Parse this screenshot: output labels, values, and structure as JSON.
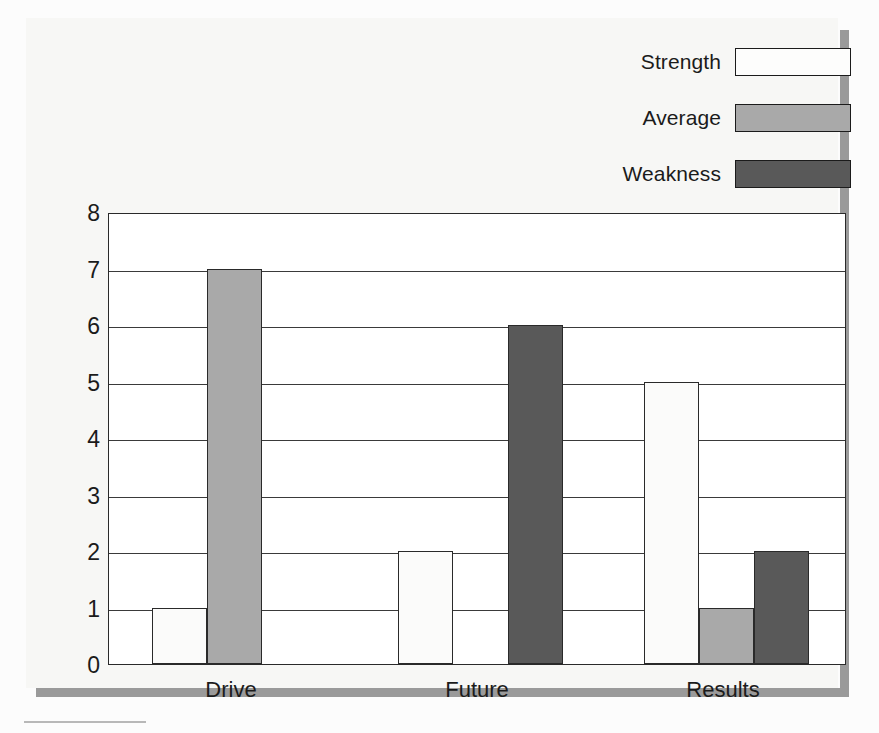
{
  "chart_data": {
    "type": "bar",
    "title": "",
    "subtitle": "",
    "xlabel": "",
    "ylabel": "",
    "categories": [
      "Drive",
      "Future",
      "Results"
    ],
    "series": [
      {
        "name": "Strength",
        "values": [
          1,
          2,
          5
        ],
        "color": "#fdfdfc"
      },
      {
        "name": "Average",
        "values": [
          7,
          0,
          1
        ],
        "color": "#a9a9a9"
      },
      {
        "name": "Weakness",
        "values": [
          0,
          6,
          2
        ],
        "color": "#595959"
      }
    ],
    "ylim": [
      0,
      8
    ],
    "yticks": [
      0,
      1,
      2,
      3,
      4,
      5,
      6,
      7,
      8
    ],
    "ytick_labels": [
      "0",
      "1",
      "2",
      "3",
      "4",
      "5",
      "6",
      "7",
      "8"
    ],
    "grid": true,
    "grid_axis": "y",
    "legend_position": "top-right",
    "annotations": []
  },
  "legend": {
    "items": [
      {
        "label": "Strength",
        "swatch": "legend-swatch-strength"
      },
      {
        "label": "Average",
        "swatch": "legend-swatch-average"
      },
      {
        "label": "Weakness",
        "swatch": "legend-swatch-weakness"
      }
    ]
  },
  "colors": {
    "strength": "#fdfdfc",
    "average": "#a9a9a9",
    "weakness": "#595959",
    "axis": "#2a2a2a",
    "grid": "#3a3a3a",
    "card_background": "#f7f7f5",
    "plot_background": "#ffffff",
    "shadow": "#9a9a9a"
  }
}
